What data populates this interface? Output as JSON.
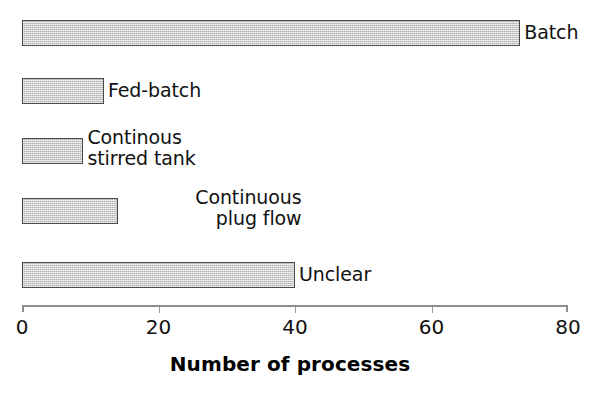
{
  "chart_data": {
    "type": "bar",
    "orientation": "horizontal",
    "title": "",
    "xlabel": "Number of processes",
    "ylabel": "",
    "xlim": [
      0,
      80
    ],
    "xticks": [
      0,
      20,
      40,
      60,
      80
    ],
    "xtick_labels": [
      "0",
      "20",
      "40",
      "60",
      "80"
    ],
    "grid": false,
    "legend": false,
    "bar_color": "#c9c9c9",
    "bar_edge_color": "#4a4a4a",
    "categories": [
      "Batch",
      "Fed-batch",
      "Continous stirred tank",
      "Continuous plug flow",
      "Unclear"
    ],
    "values": [
      73,
      12,
      9,
      14,
      40
    ],
    "bars": [
      {
        "label": "Batch",
        "label_lines": [
          "Batch"
        ],
        "value": 73,
        "label_align": "left"
      },
      {
        "label": "Fed-batch",
        "label_lines": [
          "Fed-batch"
        ],
        "value": 12,
        "label_align": "left"
      },
      {
        "label": "Continous stirred tank",
        "label_lines": [
          "Continous",
          "stirred tank"
        ],
        "value": 9,
        "label_align": "left"
      },
      {
        "label": "Continuous plug flow",
        "label_lines": [
          "Continuous",
          "plug flow"
        ],
        "value": 14,
        "label_align": "right"
      },
      {
        "label": "Unclear",
        "label_lines": [
          "Unclear"
        ],
        "value": 40,
        "label_align": "left"
      }
    ]
  }
}
